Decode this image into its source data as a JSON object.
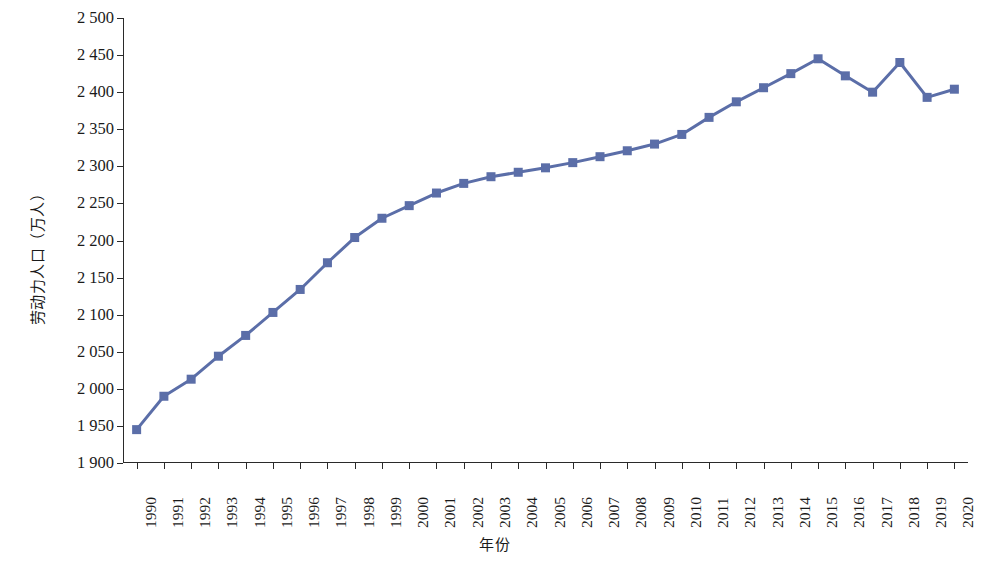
{
  "chart_data": {
    "type": "line",
    "title": "",
    "xlabel": "年份",
    "ylabel": "劳动力人口（万人）",
    "series_name": "劳动力人口",
    "series_color": "#5b6ea8",
    "marker": "square",
    "grid": false,
    "legend": "none",
    "ylim": [
      1900,
      2500
    ],
    "ytick_step": 50,
    "ytick_labels": [
      "2 500",
      "2 450",
      "2 400",
      "2 350",
      "2 300",
      "2 250",
      "2 200",
      "2 150",
      "2 100",
      "2 050",
      "2 000",
      "1 950",
      "1 900"
    ],
    "ytick_values": [
      2500,
      2450,
      2400,
      2350,
      2300,
      2250,
      2200,
      2150,
      2100,
      2050,
      2000,
      1950,
      1900
    ],
    "categories": [
      "1990",
      "1991",
      "1992",
      "1993",
      "1994",
      "1995",
      "1996",
      "1997",
      "1998",
      "1999",
      "2000",
      "2001",
      "2002",
      "2003",
      "2004",
      "2005",
      "2006",
      "2007",
      "2008",
      "2009",
      "2010",
      "2011",
      "2012",
      "2013",
      "2014",
      "2015",
      "2016",
      "2017",
      "2018",
      "2019",
      "2020"
    ],
    "values": [
      1945,
      1990,
      2013,
      2044,
      2072,
      2103,
      2134,
      2170,
      2204,
      2230,
      2247,
      2264,
      2277,
      2286,
      2292,
      2298,
      2305,
      2313,
      2321,
      2330,
      2343,
      2366,
      2387,
      2406,
      2425,
      2445,
      2422,
      2400,
      2440,
      2393,
      2404
    ]
  }
}
